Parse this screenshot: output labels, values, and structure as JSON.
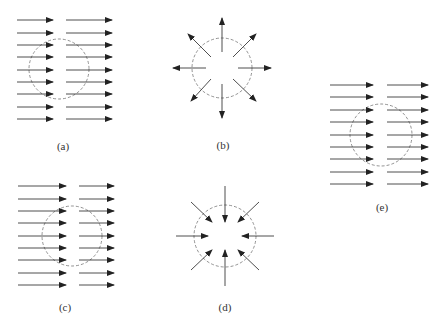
{
  "panels": [
    {
      "id": "a",
      "label": "(a)",
      "type": "uniform-field",
      "center": [
        59,
        69
      ],
      "radius": 30,
      "label_pos": [
        63,
        150
      ]
    },
    {
      "id": "b",
      "label": "(b)",
      "type": "radial-outward",
      "center": [
        222,
        68
      ],
      "radius": 30,
      "label_pos": [
        223,
        149
      ]
    },
    {
      "id": "c",
      "label": "(c)",
      "type": "uniform-field",
      "center": [
        72,
        236
      ],
      "radius": 30,
      "label_pos": [
        65,
        311
      ]
    },
    {
      "id": "d",
      "label": "(d)",
      "type": "radial-inward",
      "center": [
        225,
        236
      ],
      "radius": 31,
      "label_pos": [
        225,
        311
      ]
    },
    {
      "id": "e",
      "label": "(e)",
      "type": "uniform-field",
      "center": [
        381,
        135
      ],
      "radius": 31,
      "label_pos": [
        382,
        211
      ]
    }
  ],
  "colors": {
    "arrow": "#222222",
    "circle": "#777777",
    "label": "#333333"
  }
}
